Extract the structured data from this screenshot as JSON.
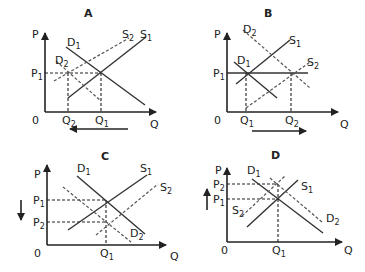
{
  "panels": {
    "A": {
      "title": "A",
      "y_axis": "P",
      "x_axis": "Q",
      "origin": "0",
      "labels": {
        "D1": "D",
        "D1_sub": "1",
        "D2": "D",
        "D2_sub": "2",
        "S1": "S",
        "S1_sub": "1",
        "S2": "S",
        "S2_sub": "2",
        "P1": "P",
        "P1_sub": "1",
        "Q1": "Q",
        "Q1_sub": "1",
        "Q2": "Q",
        "Q2_sub": "2"
      },
      "arrow": "left (quantity decreases from Q1 to Q2)"
    },
    "B": {
      "title": "B",
      "y_axis": "P",
      "x_axis": "Q",
      "origin": "0",
      "labels": {
        "D1": "D",
        "D1_sub": "1",
        "D2": "D",
        "D2_sub": "2",
        "S1": "S",
        "S1_sub": "1",
        "S2": "S",
        "S2_sub": "2",
        "P1": "P",
        "P1_sub": "1",
        "Q1": "Q",
        "Q1_sub": "1",
        "Q2": "Q",
        "Q2_sub": "2"
      },
      "arrow": "right (quantity increases from Q1 to Q2)"
    },
    "C": {
      "title": "C",
      "y_axis": "P",
      "x_axis": "Q",
      "origin": "0",
      "labels": {
        "D1": "D",
        "D1_sub": "1",
        "D2": "D",
        "D2_sub": "2",
        "S1": "S",
        "S1_sub": "1",
        "S2": "S",
        "S2_sub": "2",
        "P1": "P",
        "P1_sub": "1",
        "P2": "P",
        "P2_sub": "2",
        "Q1": "Q",
        "Q1_sub": "1"
      },
      "arrow": "down (price decreases from P1 to P2)"
    },
    "D": {
      "title": "D",
      "y_axis": "P",
      "x_axis": "Q",
      "origin": "0",
      "labels": {
        "D1": "D",
        "D1_sub": "1",
        "D2": "D",
        "D2_sub": "2",
        "S1": "S",
        "S1_sub": "1",
        "S2": "S",
        "S2_sub": "2",
        "P1": "P",
        "P1_sub": "1",
        "P2": "P",
        "P2_sub": "2",
        "Q1": "Q",
        "Q1_sub": "1"
      },
      "arrow": "up (price increases from P1 to P2)"
    }
  },
  "legend": {
    "solid_lines": "original curves (D1, S1)",
    "dashed_lines": "shifted curves (D2, S2)"
  }
}
